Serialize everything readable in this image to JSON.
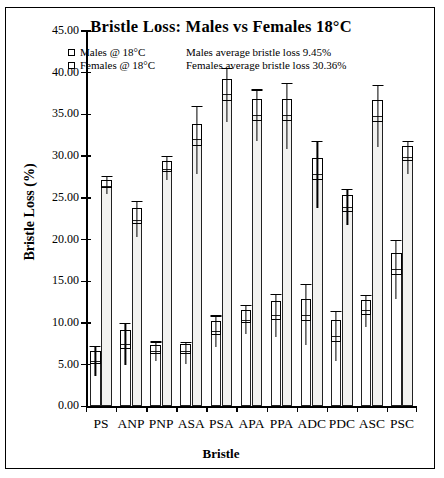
{
  "chart_data": {
    "type": "bar",
    "title": "Bristle Loss: Males vs Females 18°C",
    "xlabel": "Bristle",
    "ylabel": "Bristle Loss (%)",
    "ylim": [
      0,
      45
    ],
    "ytick_step": 5,
    "ytick_labels": [
      "0.00",
      "5.00",
      "10.00",
      "15.00",
      "20.00",
      "25.00",
      "30.00",
      "35.00",
      "40.00",
      "45.00"
    ],
    "grid": false,
    "legend_position": "top-inside",
    "categories": [
      "PS",
      "ANP",
      "PNP",
      "ASA",
      "PSA",
      "APA",
      "PPA",
      "ADC",
      "PDC",
      "ASC",
      "PSC"
    ],
    "series": [
      {
        "name": "Males @ 18°C",
        "values": [
          5.5,
          7.5,
          6.6,
          6.6,
          9.0,
          10.4,
          11.0,
          11.0,
          8.5,
          11.5,
          16.5
        ],
        "err_low": [
          3.7,
          5.0,
          5.4,
          5.1,
          7.1,
          8.7,
          8.3,
          7.3,
          5.5,
          9.5,
          12.9
        ],
        "err_high": [
          7.3,
          10.0,
          7.8,
          7.7,
          10.9,
          12.2,
          13.5,
          14.7,
          11.4,
          13.4,
          20.0
        ]
      },
      {
        "name": "Females @ 18°C",
        "values": [
          26.4,
          22.4,
          28.5,
          32.0,
          37.4,
          34.9,
          34.9,
          27.9,
          23.9,
          34.8,
          29.9
        ],
        "err_low": [
          25.4,
          20.3,
          27.1,
          27.9,
          34.1,
          31.8,
          30.8,
          23.8,
          21.8,
          31.1,
          27.9
        ],
        "err_high": [
          27.6,
          24.6,
          30.0,
          36.0,
          40.6,
          38.0,
          38.8,
          31.8,
          26.1,
          38.5,
          31.8
        ]
      }
    ],
    "annotations": [
      "Males average bristle loss 9.45%",
      "Females average bristle loss 30.36%"
    ]
  },
  "legend": {
    "items": [
      {
        "label": "Males @ 18°C",
        "note": "Males average bristle loss 9.45%"
      },
      {
        "label": "Females @ 18°C",
        "note": "Females average bristle loss 30.36%"
      }
    ]
  }
}
